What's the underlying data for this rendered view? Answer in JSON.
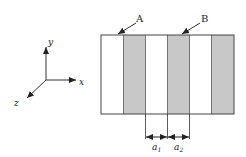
{
  "axes": {
    "x_label": "x",
    "y_label": "y",
    "z_label": "z"
  },
  "stripes": [
    {
      "fill": "#ffffff"
    },
    {
      "fill": "#c8c8c8"
    },
    {
      "fill": "#ffffff"
    },
    {
      "fill": "#c8c8c8"
    },
    {
      "fill": "#ffffff"
    },
    {
      "fill": "#c8c8c8"
    }
  ],
  "labels": {
    "A": "A",
    "B": "B",
    "a1": "a",
    "a1_sub": "1",
    "a2": "a",
    "a2_sub": "2"
  },
  "colors": {
    "line": "#333333",
    "gray_stripe": "#c8c8c8"
  }
}
